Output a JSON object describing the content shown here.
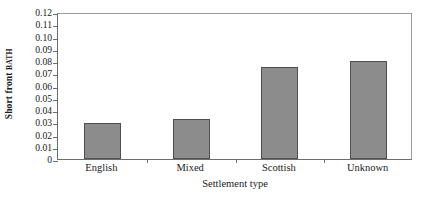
{
  "chart_data": {
    "type": "bar",
    "title": "",
    "categories": [
      "English",
      "Mixed",
      "Scottish",
      "Unknown"
    ],
    "values": [
      0.029,
      0.033,
      0.075,
      0.08
    ],
    "series": [
      {
        "name": "Short front BATH",
        "values": [
          0.029,
          0.033,
          0.075,
          0.08
        ]
      }
    ],
    "xlabel": "Settlement type",
    "ylabel": "Short front BATH",
    "ylabel_main": "Short front ",
    "ylabel_smallcaps": "BATH",
    "ylim": [
      0,
      0.12
    ],
    "ytick_values": [
      0,
      0.01,
      0.02,
      0.03,
      0.04,
      0.05,
      0.06,
      0.07,
      0.08,
      0.09,
      0.1,
      0.11,
      0.12
    ],
    "ytick_labels": [
      "0",
      "0.01",
      "0.02",
      "0.03",
      "0.04",
      "0.05",
      "0.06",
      "0.07",
      "0.08",
      "0.09",
      "0.10",
      "0.11",
      "0.12"
    ],
    "grid": false,
    "legend": false,
    "legend_position": "none",
    "bar_fill_color": "#8c8c8c",
    "bar_border_color": "#4f4f4f",
    "axis_color": "#6d6d6d",
    "background_color": "#ffffff"
  }
}
